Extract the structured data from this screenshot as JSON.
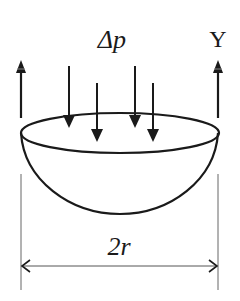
{
  "diagram": {
    "title": "",
    "labels": {
      "pressure": "Δp",
      "tension": "Y",
      "diameter": "2r"
    },
    "elements": {
      "hemisphere_bowl": {
        "type": "hemispherical shell",
        "rim": "ellipse",
        "orientation": "opening upward"
      },
      "pressure_arrows": {
        "count": 4,
        "direction": "down"
      },
      "tension_arrows": {
        "count": 2,
        "direction": "up",
        "positions": [
          "left rim edge",
          "right rim edge"
        ]
      },
      "dimension_line": {
        "type": "double-headed arrow",
        "spans": "rim diameter"
      }
    },
    "colors": {
      "stroke": "#1a1a1a",
      "dimension": "#555555",
      "background": "#ffffff"
    }
  }
}
